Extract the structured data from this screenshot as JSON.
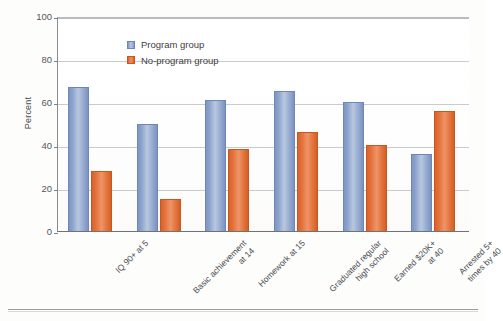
{
  "chart_data": {
    "type": "bar",
    "title": "",
    "xlabel": "",
    "ylabel": "Percent",
    "ylim": [
      0,
      100
    ],
    "ytick_values": [
      100,
      80,
      60,
      40,
      20,
      0
    ],
    "ytick_labels": [
      "100",
      "80",
      "60",
      "40",
      "20",
      "0"
    ],
    "grid": "horizontal",
    "legend_position": "upper-left-inside",
    "categories": [
      "IQ 90+ at 5",
      "Basic achievement at 14",
      "Homework at 15",
      "Graduated regular high school",
      "Earned $20K+ at 40",
      "Arrested 5+ times by 40"
    ],
    "category_lines": [
      [
        "IQ 90+ at 5"
      ],
      [
        "Basic achievement",
        "at 14"
      ],
      [
        "Homework at 15"
      ],
      [
        "Graduated regular",
        "high school"
      ],
      [
        "Earned $20K+",
        "at 40"
      ],
      [
        "Arrested 5+",
        "times by 40"
      ]
    ],
    "series": [
      {
        "name": "Program group",
        "color": "#8ba3cd",
        "values": [
          67,
          50,
          61,
          65,
          60,
          36
        ]
      },
      {
        "name": "No-program group",
        "color": "#e4713a",
        "values": [
          28,
          15,
          38,
          46,
          40,
          56
        ]
      }
    ]
  },
  "legend": {
    "items": [
      {
        "label": "Program group",
        "swatch": "blue"
      },
      {
        "label": "No-program group",
        "swatch": "orange"
      }
    ]
  }
}
